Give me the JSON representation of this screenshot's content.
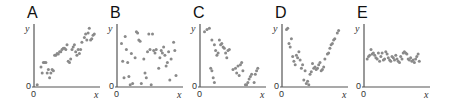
{
  "figure": {
    "panels": [
      {
        "letter": "A",
        "xlabel": "x",
        "ylabel": "y",
        "origin_x": "0",
        "origin_y": "0",
        "relationship": "positive linear"
      },
      {
        "letter": "B",
        "xlabel": "x",
        "ylabel": "y",
        "origin_x": "0",
        "origin_y": "0",
        "relationship": "no correlation"
      },
      {
        "letter": "C",
        "xlabel": "x",
        "ylabel": "y",
        "origin_x": "0",
        "origin_y": "0",
        "relationship": "negative linear"
      },
      {
        "letter": "D",
        "xlabel": "x",
        "ylabel": "y",
        "origin_x": "0",
        "origin_y": "0",
        "relationship": "nonlinear U-shaped"
      },
      {
        "letter": "E",
        "xlabel": "x",
        "ylabel": "y",
        "origin_x": "0",
        "origin_y": "0",
        "relationship": "no relationship, constant y"
      }
    ],
    "point_color": "#8a8a8a",
    "axis_color": "#555555"
  },
  "chart_data": [
    {
      "type": "scatter",
      "title": "A",
      "xlabel": "x",
      "ylabel": "y",
      "xlim": [
        0,
        1
      ],
      "ylim": [
        0,
        1
      ],
      "grid": false,
      "points": [
        [
          0.02,
          0.02
        ],
        [
          0.08,
          0.32
        ],
        [
          0.1,
          0.22
        ],
        [
          0.12,
          0.4
        ],
        [
          0.14,
          0.4
        ],
        [
          0.16,
          0.4
        ],
        [
          0.18,
          0.22
        ],
        [
          0.2,
          0.28
        ],
        [
          0.22,
          0.14
        ],
        [
          0.24,
          0.22
        ],
        [
          0.26,
          0.28
        ],
        [
          0.28,
          0.26
        ],
        [
          0.3,
          0.52
        ],
        [
          0.32,
          0.52
        ],
        [
          0.34,
          0.55
        ],
        [
          0.36,
          0.54
        ],
        [
          0.38,
          0.58
        ],
        [
          0.4,
          0.58
        ],
        [
          0.42,
          0.62
        ],
        [
          0.44,
          0.64
        ],
        [
          0.46,
          0.64
        ],
        [
          0.48,
          0.62
        ],
        [
          0.5,
          0.7
        ],
        [
          0.52,
          0.42
        ],
        [
          0.54,
          0.4
        ],
        [
          0.56,
          0.46
        ],
        [
          0.58,
          0.62
        ],
        [
          0.6,
          0.66
        ],
        [
          0.62,
          0.7
        ],
        [
          0.64,
          0.58
        ],
        [
          0.66,
          0.52
        ],
        [
          0.68,
          0.62
        ],
        [
          0.7,
          0.55
        ],
        [
          0.72,
          0.62
        ],
        [
          0.74,
          0.74
        ],
        [
          0.78,
          0.82
        ],
        [
          0.8,
          0.88
        ],
        [
          0.82,
          0.78
        ],
        [
          0.84,
          0.9
        ],
        [
          0.86,
          0.98
        ],
        [
          0.88,
          0.78
        ],
        [
          0.9,
          0.8
        ],
        [
          0.92,
          0.86
        ],
        [
          0.94,
          0.88
        ]
      ]
    },
    {
      "type": "scatter",
      "title": "B",
      "xlabel": "x",
      "ylabel": "y",
      "xlim": [
        0,
        1
      ],
      "ylim": [
        0,
        1
      ],
      "grid": false,
      "points": [
        [
          0.04,
          0.72
        ],
        [
          0.06,
          0.42
        ],
        [
          0.08,
          0.14
        ],
        [
          0.1,
          0.84
        ],
        [
          0.12,
          0.62
        ],
        [
          0.14,
          0.4
        ],
        [
          0.16,
          0.16
        ],
        [
          0.18,
          0.02
        ],
        [
          0.2,
          0.55
        ],
        [
          0.22,
          0.04
        ],
        [
          0.26,
          0.48
        ],
        [
          0.28,
          0.92
        ],
        [
          0.3,
          0.9
        ],
        [
          0.32,
          0.78
        ],
        [
          0.34,
          0.76
        ],
        [
          0.36,
          0.04
        ],
        [
          0.4,
          0.46
        ],
        [
          0.42,
          0.22
        ],
        [
          0.44,
          0.14
        ],
        [
          0.46,
          0.58
        ],
        [
          0.48,
          0.88
        ],
        [
          0.5,
          0.62
        ],
        [
          0.52,
          0.02
        ],
        [
          0.54,
          0.88
        ],
        [
          0.56,
          0.6
        ],
        [
          0.58,
          0.56
        ],
        [
          0.6,
          0.62
        ],
        [
          0.64,
          0.3
        ],
        [
          0.66,
          0.48
        ],
        [
          0.68,
          0.6
        ],
        [
          0.7,
          0.56
        ],
        [
          0.72,
          0.66
        ],
        [
          0.74,
          0.52
        ],
        [
          0.76,
          0.34
        ],
        [
          0.78,
          0.4
        ],
        [
          0.8,
          0.58
        ],
        [
          0.82,
          0.1
        ],
        [
          0.84,
          0.46
        ],
        [
          0.88,
          0.74
        ],
        [
          0.9,
          0.6
        ],
        [
          0.92,
          0.18
        ]
      ]
    },
    {
      "type": "scatter",
      "title": "C",
      "xlabel": "x",
      "ylabel": "y",
      "xlim": [
        0,
        1
      ],
      "ylim": [
        0,
        1
      ],
      "grid": false,
      "points": [
        [
          0.04,
          0.92
        ],
        [
          0.08,
          0.96
        ],
        [
          0.12,
          0.98
        ],
        [
          0.16,
          0.78
        ],
        [
          0.2,
          0.7
        ],
        [
          0.22,
          0.6
        ],
        [
          0.24,
          0.52
        ],
        [
          0.26,
          0.56
        ],
        [
          0.28,
          0.78
        ],
        [
          0.3,
          0.7
        ],
        [
          0.32,
          0.72
        ],
        [
          0.34,
          0.66
        ],
        [
          0.36,
          0.64
        ],
        [
          0.38,
          0.56
        ],
        [
          0.4,
          0.48
        ],
        [
          0.42,
          0.6
        ],
        [
          0.44,
          0.62
        ],
        [
          0.14,
          0.3
        ],
        [
          0.16,
          0.26
        ],
        [
          0.18,
          0.14
        ],
        [
          0.2,
          0.06
        ],
        [
          0.5,
          0.28
        ],
        [
          0.54,
          0.3
        ],
        [
          0.56,
          0.22
        ],
        [
          0.58,
          0.34
        ],
        [
          0.6,
          0.18
        ],
        [
          0.62,
          0.36
        ],
        [
          0.64,
          0.4
        ],
        [
          0.66,
          0.26
        ],
        [
          0.7,
          0.02
        ],
        [
          0.72,
          0.02
        ],
        [
          0.74,
          0.06
        ],
        [
          0.76,
          0.12
        ],
        [
          0.78,
          0.16
        ],
        [
          0.8,
          0.2
        ],
        [
          0.84,
          0.06
        ],
        [
          0.86,
          0.2
        ],
        [
          0.88,
          0.26
        ],
        [
          0.9,
          0.3
        ]
      ]
    },
    {
      "type": "scatter",
      "title": "D",
      "xlabel": "x",
      "ylabel": "y",
      "xlim": [
        0,
        1
      ],
      "ylim": [
        0,
        1
      ],
      "grid": false,
      "points": [
        [
          0.04,
          0.96
        ],
        [
          0.06,
          0.98
        ],
        [
          0.08,
          0.72
        ],
        [
          0.1,
          0.66
        ],
        [
          0.12,
          0.8
        ],
        [
          0.14,
          0.5
        ],
        [
          0.16,
          0.42
        ],
        [
          0.18,
          0.36
        ],
        [
          0.2,
          0.52
        ],
        [
          0.22,
          0.48
        ],
        [
          0.24,
          0.58
        ],
        [
          0.26,
          0.44
        ],
        [
          0.28,
          0.3
        ],
        [
          0.3,
          0.36
        ],
        [
          0.32,
          0.1
        ],
        [
          0.34,
          0.26
        ],
        [
          0.36,
          0.04
        ],
        [
          0.38,
          0.08
        ],
        [
          0.4,
          0.02
        ],
        [
          0.42,
          0.2
        ],
        [
          0.44,
          0.24
        ],
        [
          0.46,
          0.38
        ],
        [
          0.48,
          0.3
        ],
        [
          0.5,
          0.32
        ],
        [
          0.52,
          0.28
        ],
        [
          0.54,
          0.3
        ],
        [
          0.56,
          0.36
        ],
        [
          0.58,
          0.4
        ],
        [
          0.6,
          0.26
        ],
        [
          0.62,
          0.28
        ],
        [
          0.64,
          0.32
        ],
        [
          0.66,
          0.46
        ],
        [
          0.7,
          0.54
        ],
        [
          0.72,
          0.56
        ],
        [
          0.74,
          0.64
        ],
        [
          0.76,
          0.7
        ],
        [
          0.78,
          0.72
        ],
        [
          0.8,
          0.78
        ],
        [
          0.82,
          0.8
        ],
        [
          0.86,
          0.9
        ],
        [
          0.88,
          0.94
        ]
      ]
    },
    {
      "type": "scatter",
      "title": "E",
      "xlabel": "x",
      "ylabel": "y",
      "xlim": [
        0,
        1
      ],
      "ylim": [
        0,
        1
      ],
      "grid": false,
      "points": [
        [
          0.02,
          0.46
        ],
        [
          0.04,
          0.5
        ],
        [
          0.06,
          0.52
        ],
        [
          0.08,
          0.62
        ],
        [
          0.1,
          0.54
        ],
        [
          0.12,
          0.56
        ],
        [
          0.14,
          0.52
        ],
        [
          0.16,
          0.48
        ],
        [
          0.18,
          0.46
        ],
        [
          0.2,
          0.56
        ],
        [
          0.22,
          0.42
        ],
        [
          0.24,
          0.5
        ],
        [
          0.26,
          0.56
        ],
        [
          0.28,
          0.44
        ],
        [
          0.3,
          0.46
        ],
        [
          0.32,
          0.58
        ],
        [
          0.34,
          0.54
        ],
        [
          0.36,
          0.48
        ],
        [
          0.38,
          0.44
        ],
        [
          0.4,
          0.42
        ],
        [
          0.42,
          0.5
        ],
        [
          0.44,
          0.48
        ],
        [
          0.46,
          0.44
        ],
        [
          0.48,
          0.52
        ],
        [
          0.5,
          0.46
        ],
        [
          0.52,
          0.42
        ],
        [
          0.54,
          0.4
        ],
        [
          0.56,
          0.5
        ],
        [
          0.58,
          0.46
        ],
        [
          0.6,
          0.56
        ],
        [
          0.62,
          0.58
        ],
        [
          0.64,
          0.56
        ],
        [
          0.66,
          0.54
        ],
        [
          0.68,
          0.46
        ],
        [
          0.7,
          0.44
        ],
        [
          0.72,
          0.48
        ],
        [
          0.74,
          0.42
        ],
        [
          0.76,
          0.44
        ],
        [
          0.78,
          0.4
        ],
        [
          0.8,
          0.46
        ],
        [
          0.82,
          0.5
        ],
        [
          0.84,
          0.54
        ],
        [
          0.86,
          0.42
        ]
      ]
    }
  ]
}
